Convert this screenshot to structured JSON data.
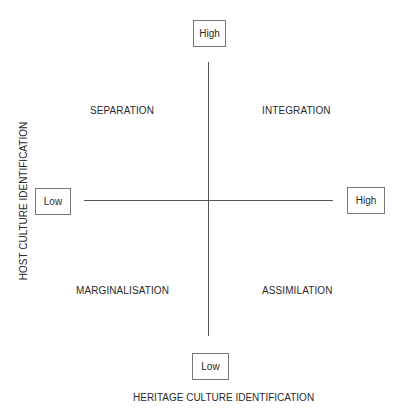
{
  "diagram": {
    "type": "two-dimensional acculturation model",
    "x_axis": {
      "title": "HERITAGE CULTURE IDENTIFICATION",
      "low_label": "Low",
      "high_label": "High"
    },
    "y_axis": {
      "title": "HOST CULTURE IDENTIFICATION",
      "low_label": "Low",
      "high_label": "High"
    },
    "quadrants": {
      "top_left": "SEPARATION",
      "top_right": "INTEGRATION",
      "bottom_left": "MARGINALISATION",
      "bottom_right": "ASSIMILATION"
    }
  }
}
